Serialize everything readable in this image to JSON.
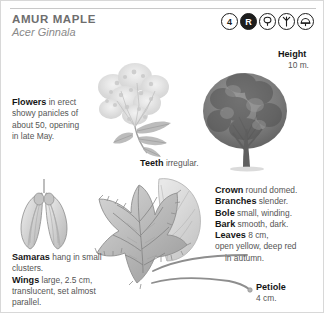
{
  "header": {
    "common_name": "AMUR MAPLE",
    "botanical_name": "Acer Ginnala",
    "symbols": [
      {
        "name": "hardiness-zone-icon",
        "label": "4",
        "style": "outline"
      },
      {
        "name": "registered-mark-icon",
        "label": "R",
        "style": "filled"
      },
      {
        "name": "round-crown-shape-icon",
        "label": "",
        "style": "outline"
      },
      {
        "name": "upright-vase-shape-icon",
        "label": "",
        "style": "outline"
      },
      {
        "name": "shade-tree-icon",
        "label": "",
        "style": "outline"
      }
    ]
  },
  "captions": {
    "flowers": {
      "term": "Flowers",
      "text": " in erect showy panicles of about 50, opening in late May."
    },
    "teeth": {
      "term": "Teeth",
      "text": " irregular."
    },
    "height": {
      "term": "Height",
      "text": "10 m."
    },
    "crown": [
      {
        "term": "Crown",
        "text": " round domed."
      },
      {
        "term": "Branches",
        "text": " slender."
      },
      {
        "term": "Bole",
        "text": " small, winding."
      },
      {
        "term": "Bark",
        "text": " smooth, dark."
      }
    ],
    "leaves": {
      "term": "Leaves",
      "text": " 8 cm,",
      "line2": "open yellow, deep red",
      "line3": "in autumn."
    },
    "samaras": {
      "term": "Samaras",
      "text": " hang in small clusters."
    },
    "wings": {
      "term": "Wings",
      "text": " large, 2.5 cm, translucent, set almost parallel."
    },
    "petiole": {
      "term": "Petiole",
      "text": "4 cm."
    }
  },
  "colors": {
    "ink": "#3a3a3a",
    "term": "#151515",
    "title": "#6e6e6e",
    "rule": "#c9c9c9",
    "illustration_gray": "#9a9a9a"
  }
}
